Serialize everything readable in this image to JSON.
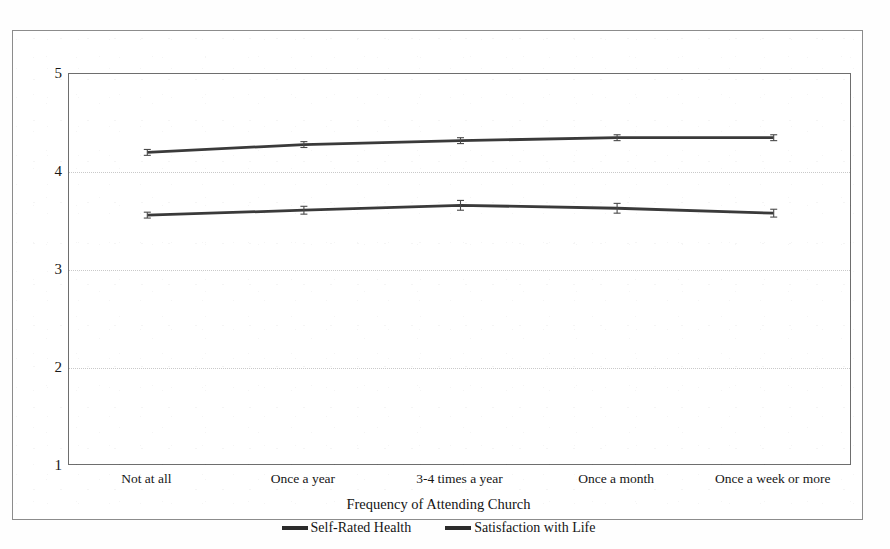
{
  "chart_data": {
    "type": "line",
    "title": "",
    "xlabel": "Frequency of Attending Church",
    "ylabel": "",
    "categories": [
      "Not at all",
      "Once a year",
      "3-4 times a year",
      "Once a month",
      "Once a week or more"
    ],
    "series": [
      {
        "name": "Satisfaction with Life",
        "values": [
          4.2,
          4.28,
          4.32,
          4.35,
          4.35
        ],
        "error": [
          0.03,
          0.03,
          0.03,
          0.03,
          0.03
        ],
        "color": "#3a3a3a"
      },
      {
        "name": "Self-Rated Health",
        "values": [
          3.56,
          3.61,
          3.66,
          3.63,
          3.58
        ],
        "error": [
          0.03,
          0.04,
          0.05,
          0.05,
          0.04
        ],
        "color": "#3a3a3a"
      }
    ],
    "ylim": [
      1,
      5
    ],
    "yticks": [
      1,
      2,
      3,
      4,
      5
    ],
    "ytick_labels": [
      "1",
      "2",
      "3",
      "4",
      "5"
    ],
    "gridlines_at": [
      2,
      3,
      4
    ],
    "grid": true,
    "legend_position": "bottom",
    "legend_entries": [
      "Self-Rated Health",
      "Satisfaction with Life"
    ]
  },
  "axes": {
    "y_ticks": [
      {
        "value": 5,
        "label": "5"
      },
      {
        "value": 4,
        "label": "4"
      },
      {
        "value": 3,
        "label": "3"
      },
      {
        "value": 2,
        "label": "2"
      },
      {
        "value": 1,
        "label": "1"
      }
    ],
    "x_ticks": [
      {
        "index": 0,
        "label": "Not at all"
      },
      {
        "index": 1,
        "label": "Once a year"
      },
      {
        "index": 2,
        "label": "3-4 times a year"
      },
      {
        "index": 3,
        "label": "Once a month"
      },
      {
        "index": 4,
        "label": "Once a week or more"
      }
    ],
    "x_title": "Frequency of Attending Church"
  },
  "legend": {
    "items": [
      {
        "label": "Self-Rated Health",
        "color": "#2b2b2b"
      },
      {
        "label": "Satisfaction with Life",
        "color": "#2b2b2b"
      }
    ]
  },
  "colors": {
    "series_line": "#3a3a3a",
    "grid": "#c9c9c9",
    "axis": "#6e6e6e",
    "frame": "#8c8c8c",
    "text": "#141414",
    "background": "#ffffff"
  }
}
